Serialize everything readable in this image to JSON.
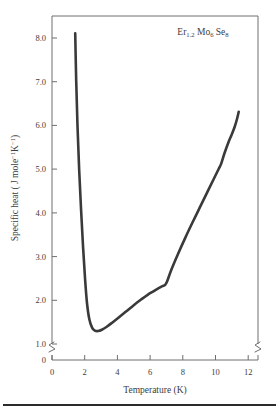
{
  "chart_data": {
    "type": "line",
    "title": "",
    "annotation": "Er1.2 Mo6 Se8",
    "annotation_parts": {
      "el1": "Er",
      "el1_sub": "1.2",
      "el2": "Mo",
      "el2_sub": "6",
      "el3": "Se",
      "el3_sub": "8"
    },
    "xlabel": "Temperature (K)",
    "ylabel": "Specific heat ( J mole⁻¹K⁻¹)",
    "ylabel_parts": {
      "lead": "Specific heat ( J mole",
      "sup1": "−1",
      "mid": "K",
      "sup2": "−1",
      "tail": ")"
    },
    "xlim": [
      0,
      12.6
    ],
    "ylim": [
      1.0,
      8.6
    ],
    "y_axis_break": true,
    "y_zero_label": "0",
    "grid": false,
    "legend": "none",
    "xticks": [
      0,
      2,
      4,
      6,
      8,
      10,
      12
    ],
    "xtick_labels": [
      "0",
      "2",
      "4",
      "6",
      "8",
      "10",
      "12"
    ],
    "yticks": [
      1.0,
      2.0,
      3.0,
      4.0,
      5.0,
      6.0,
      7.0,
      8.0
    ],
    "ytick_labels": [
      "1.0",
      "2.0",
      "3.0",
      "4.0",
      "5.0",
      "6.0",
      "7.0",
      "8.0"
    ],
    "series": [
      {
        "name": "Er1.2Mo6Se8 specific heat",
        "color": "#3a3a3a",
        "x": [
          1.42,
          1.48,
          1.56,
          1.66,
          1.78,
          1.9,
          2.02,
          2.14,
          2.28,
          2.45,
          2.62,
          2.82,
          3.05,
          3.35,
          3.7,
          4.1,
          4.55,
          5.0,
          5.45,
          5.85,
          6.2,
          6.5,
          6.75,
          6.92,
          7.05,
          7.3,
          7.7,
          8.15,
          8.6,
          9.05,
          9.5,
          9.9,
          10.2,
          10.35,
          10.55,
          10.8,
          11.0,
          11.18,
          11.32,
          11.42
        ],
        "y": [
          8.2,
          7.1,
          6.05,
          5.05,
          4.1,
          3.25,
          2.52,
          1.95,
          1.58,
          1.38,
          1.31,
          1.3,
          1.33,
          1.4,
          1.5,
          1.62,
          1.76,
          1.9,
          2.03,
          2.14,
          2.22,
          2.29,
          2.34,
          2.37,
          2.46,
          2.72,
          3.08,
          3.46,
          3.82,
          4.17,
          4.52,
          4.83,
          5.06,
          5.18,
          5.42,
          5.68,
          5.86,
          6.04,
          6.22,
          6.38
        ]
      }
    ],
    "features": {
      "minimum": {
        "x": 2.1,
        "y": 1.3
      },
      "kink_low": {
        "x": 6.95,
        "y": 2.38
      },
      "kink_high": {
        "x": 10.35,
        "y": 5.18
      },
      "start": {
        "x": 1.42,
        "y": 8.2
      },
      "end": {
        "x": 11.42,
        "y": 6.38
      }
    }
  }
}
